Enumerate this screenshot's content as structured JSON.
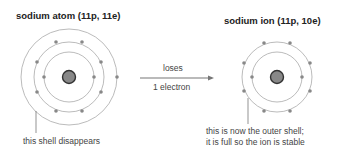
{
  "atom": {
    "title": "sodium atom (11p, 11e)",
    "annotation": "this shell disappears",
    "protons": 11,
    "electrons": 11,
    "shells": [
      2,
      8,
      1
    ]
  },
  "ion": {
    "title": "sodium ion (11p, 10e)",
    "annotation_line1": "this is now the outer shell;",
    "annotation_line2": "it is full so the ion is stable",
    "protons": 11,
    "electrons": 10,
    "shells": [
      2,
      8
    ]
  },
  "arrow": {
    "label_top": "loses",
    "label_bottom": "1 electron"
  },
  "colors": {
    "shell": "#aaaaaa",
    "electron": "#888888",
    "nucleus_fill": "#888888",
    "nucleus_stroke": "#333333",
    "arrow": "#777777"
  }
}
